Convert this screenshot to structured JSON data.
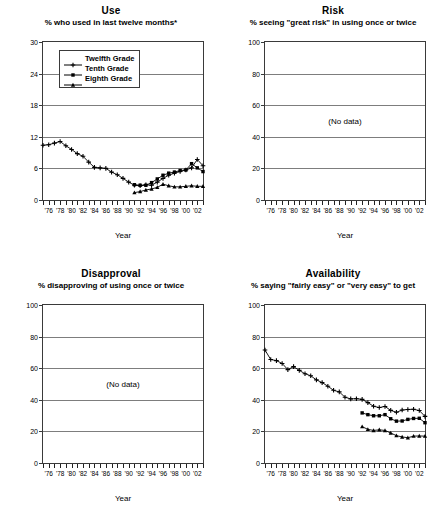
{
  "figure": {
    "axis_label": "Year",
    "no_data_text": "(No data)",
    "x_tick_labels": [
      "'76",
      "'78",
      "'80",
      "'82",
      "'84",
      "'86",
      "'88",
      "'90",
      "'92",
      "'94",
      "'96",
      "'98",
      "'00",
      "'02"
    ],
    "x_range": [
      1975,
      2003
    ],
    "legend": [
      {
        "label": "Twelfth Grade",
        "marker": "cross"
      },
      {
        "label": "Tenth Grade",
        "marker": "square"
      },
      {
        "label": "Eighth Grade",
        "marker": "triangle"
      }
    ]
  },
  "chart_data": [
    {
      "id": "use",
      "type": "line",
      "title": "Use",
      "subtitle": "% who used in last twelve months*",
      "xlabel": "Year",
      "ylabel": "",
      "ylim": [
        0,
        30
      ],
      "yticks": [
        0,
        6,
        12,
        18,
        24,
        30
      ],
      "xlim": [
        1975,
        2003
      ],
      "grid": true,
      "legend_position": "top-left",
      "series": [
        {
          "name": "Twelfth Grade",
          "marker": "cross",
          "x": [
            1975,
            1976,
            1977,
            1978,
            1979,
            1980,
            1981,
            1982,
            1983,
            1984,
            1985,
            1986,
            1987,
            1988,
            1989,
            1990,
            1991,
            1992,
            1993,
            1994,
            1995,
            1996,
            1997,
            1998,
            1999,
            2000,
            2001,
            2002,
            2003
          ],
          "values": [
            10.4,
            10.5,
            10.8,
            11.1,
            10.3,
            9.6,
            8.8,
            8.3,
            7.2,
            6.2,
            6.1,
            6.0,
            5.3,
            4.8,
            4.1,
            3.4,
            2.8,
            2.7,
            2.9,
            2.8,
            3.4,
            4.1,
            4.7,
            5.1,
            5.4,
            5.7,
            6.1,
            7.7,
            6.5
          ]
        },
        {
          "name": "Tenth Grade",
          "marker": "square",
          "x": [
            1991,
            1992,
            1993,
            1994,
            1995,
            1996,
            1997,
            1998,
            1999,
            2000,
            2001,
            2002,
            2003
          ],
          "values": [
            2.9,
            2.8,
            2.8,
            3.3,
            4.0,
            4.7,
            5.1,
            5.3,
            5.6,
            5.7,
            6.9,
            6.1,
            5.4
          ]
        },
        {
          "name": "Eighth Grade",
          "marker": "triangle",
          "x": [
            1991,
            1992,
            1993,
            1994,
            1995,
            1996,
            1997,
            1998,
            1999,
            2000,
            2001,
            2002,
            2003
          ],
          "values": [
            1.4,
            1.6,
            1.9,
            2.1,
            2.4,
            3.0,
            2.7,
            2.5,
            2.5,
            2.6,
            2.7,
            2.6,
            2.6
          ]
        }
      ]
    },
    {
      "id": "risk",
      "type": "line",
      "title": "Risk",
      "subtitle": "% seeing \"great risk\" in using once or twice",
      "xlabel": "Year",
      "ylabel": "",
      "ylim": [
        0,
        100
      ],
      "yticks": [
        0,
        20,
        40,
        60,
        80,
        100
      ],
      "xlim": [
        1975,
        2003
      ],
      "grid": true,
      "series": [],
      "annotation": "(No data)"
    },
    {
      "id": "disapproval",
      "type": "line",
      "title": "Disapproval",
      "subtitle": "% disapproving of using once or twice",
      "xlabel": "Year",
      "ylabel": "",
      "ylim": [
        0,
        100
      ],
      "yticks": [
        0,
        20,
        40,
        60,
        80,
        100
      ],
      "xlim": [
        1975,
        2003
      ],
      "grid": true,
      "series": [],
      "annotation": "(No data)"
    },
    {
      "id": "availability",
      "type": "line",
      "title": "Availability",
      "subtitle": "% saying \"fairly easy\" or \"very easy\" to get",
      "xlabel": "Year",
      "ylabel": "",
      "ylim": [
        0,
        100
      ],
      "yticks": [
        0,
        20,
        40,
        60,
        80,
        100
      ],
      "xlim": [
        1975,
        2003
      ],
      "grid": true,
      "series": [
        {
          "name": "Twelfth Grade",
          "marker": "cross",
          "x": [
            1975,
            1976,
            1977,
            1978,
            1979,
            1980,
            1981,
            1982,
            1983,
            1984,
            1985,
            1986,
            1987,
            1988,
            1989,
            1990,
            1991,
            1992,
            1993,
            1994,
            1995,
            1996,
            1997,
            1998,
            1999,
            2000,
            2001,
            2002,
            2003
          ],
          "values": [
            71.5,
            65.5,
            64.8,
            63.0,
            59.1,
            61.0,
            58.6,
            56.5,
            55.2,
            52.6,
            50.9,
            48.6,
            46.0,
            45.0,
            41.6,
            40.6,
            40.7,
            40.3,
            38.2,
            35.9,
            35.1,
            35.8,
            33.3,
            32.1,
            33.5,
            33.9,
            34.0,
            33.2,
            29.5
          ]
        },
        {
          "name": "Tenth Grade",
          "marker": "square",
          "x": [
            1992,
            1993,
            1994,
            1995,
            1996,
            1997,
            1998,
            1999,
            2000,
            2001,
            2002,
            2003
          ],
          "values": [
            31.7,
            30.6,
            29.9,
            29.9,
            30.6,
            28.0,
            26.5,
            26.6,
            27.6,
            28.2,
            28.3,
            25.5
          ]
        },
        {
          "name": "Eighth Grade",
          "marker": "triangle",
          "x": [
            1992,
            1993,
            1994,
            1995,
            1996,
            1997,
            1998,
            1999,
            2000,
            2001,
            2002,
            2003
          ],
          "values": [
            23.0,
            21.3,
            20.6,
            21.0,
            20.6,
            19.0,
            17.3,
            16.5,
            16.0,
            17.0,
            17.1,
            17.0
          ]
        }
      ]
    }
  ]
}
